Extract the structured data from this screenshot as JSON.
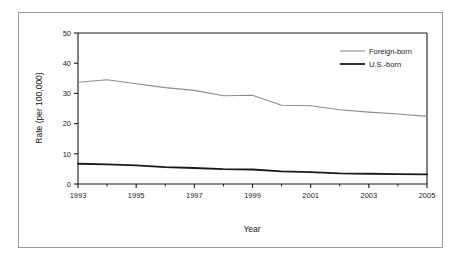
{
  "chart_data": {
    "type": "line",
    "title": "",
    "xlabel": "Year",
    "ylabel": "Rate (per 100,000)",
    "xlim": [
      1993,
      2005
    ],
    "ylim": [
      0,
      50
    ],
    "yticks": [
      0,
      10,
      20,
      30,
      40,
      50
    ],
    "xticks": [
      1993,
      1995,
      1997,
      1999,
      2001,
      2003,
      2005
    ],
    "xticks_minor": [
      1994,
      1996,
      1998,
      2000,
      2002,
      2004
    ],
    "grid": false,
    "legend_position": "top-right",
    "x": [
      1993,
      1994,
      1995,
      1996,
      1997,
      1998,
      1999,
      2000,
      2001,
      2002,
      2003,
      2004,
      2005
    ],
    "series": [
      {
        "name": "Foreign-born",
        "color": "#8c8c8c",
        "width": 1.1,
        "values": [
          33.7,
          34.5,
          33.2,
          31.9,
          31.0,
          29.2,
          29.4,
          26.1,
          25.9,
          24.6,
          23.8,
          23.2,
          22.4
        ]
      },
      {
        "name": "U.S.-born",
        "color": "#1a1a1a",
        "width": 1.8,
        "values": [
          6.7,
          6.5,
          6.2,
          5.6,
          5.3,
          4.9,
          4.8,
          4.2,
          3.9,
          3.5,
          3.4,
          3.3,
          3.2
        ]
      }
    ],
    "xtick_labels": [
      "1993",
      "1995",
      "1997",
      "1999",
      "2001",
      "2003",
      "2005"
    ],
    "ytick_labels": [
      "0",
      "10",
      "20",
      "30",
      "40",
      "50"
    ]
  },
  "legend": {
    "entries": [
      {
        "label": "Foreign-born"
      },
      {
        "label": "U.S.-born"
      }
    ]
  },
  "axes": {
    "x_title": "Year",
    "y_title": "Rate (per 100,000)"
  },
  "colors": {
    "foreign_born": "#8c8c8c",
    "us_born": "#1a1a1a",
    "axis": "#1a1a1a",
    "frame": "#9a9a9a",
    "background": "#ffffff"
  }
}
